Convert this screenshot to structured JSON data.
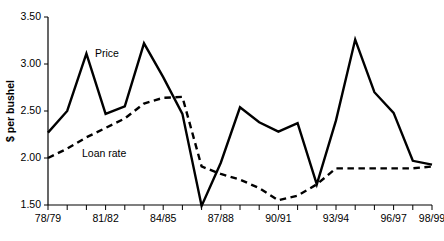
{
  "chart_data": {
    "type": "line",
    "title": "",
    "xlabel": "",
    "ylabel": "$ per bushel",
    "ylim": [
      1.5,
      3.5
    ],
    "yticks": [
      "1.50",
      "2.00",
      "2.50",
      "3.00",
      "3.50"
    ],
    "ytick_values": [
      1.5,
      2.0,
      2.5,
      3.0,
      3.5
    ],
    "grid": false,
    "legend_position": "inline-annotations",
    "categories": [
      "78/79",
      "79/80",
      "80/81",
      "81/82",
      "82/83",
      "83/84",
      "84/85",
      "85/86",
      "86/87",
      "87/88",
      "88/89",
      "89/90",
      "90/91",
      "91/92",
      "92/93",
      "93/94",
      "94/95",
      "95/96",
      "96/97",
      "97/98",
      "98/99"
    ],
    "xtick_labels_shown": [
      "78/79",
      "81/82",
      "84/85",
      "87/88",
      "90/91",
      "93/94",
      "96/97",
      "98/99"
    ],
    "xtick_label_indices": [
      0,
      3,
      6,
      9,
      12,
      15,
      18,
      20
    ],
    "series": [
      {
        "name": "Price",
        "style": "solid",
        "color": "#000000",
        "annotation": "Price",
        "values": [
          2.27,
          2.5,
          3.11,
          2.47,
          2.55,
          3.22,
          2.86,
          2.47,
          1.49,
          1.95,
          2.54,
          2.38,
          2.28,
          2.37,
          1.72,
          2.4,
          3.26,
          2.7,
          2.48,
          1.97,
          1.93
        ]
      },
      {
        "name": "Loan rate",
        "style": "dashed",
        "color": "#000000",
        "annotation": "Loan rate",
        "values": [
          2.0,
          2.1,
          2.22,
          2.32,
          2.42,
          2.58,
          2.64,
          2.65,
          1.91,
          1.83,
          1.77,
          1.68,
          1.55,
          1.6,
          1.72,
          1.89,
          1.89,
          1.89,
          1.89,
          1.89,
          1.91
        ]
      }
    ]
  },
  "annotations": {
    "price_label": "Price",
    "loan_label": "Loan rate"
  },
  "colors": {
    "axis": "#000000",
    "series": "#000000",
    "background": "#ffffff"
  }
}
